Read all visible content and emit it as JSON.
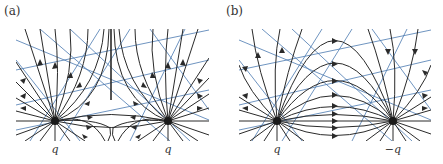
{
  "figure": {
    "panels": [
      {
        "id": "a",
        "label": "(a)",
        "description": "Field lines of two equal positive charges",
        "charges": [
          {
            "label": "q",
            "sign": "+",
            "x": 55,
            "y": 121
          },
          {
            "label": "q",
            "sign": "+",
            "x": 168,
            "y": 121
          }
        ]
      },
      {
        "id": "b",
        "label": "(b)",
        "description": "Field lines of a dipole (positive and negative charge)",
        "charges": [
          {
            "label": "q",
            "sign": "+",
            "x": 277,
            "y": 121
          },
          {
            "label": "−q",
            "sign": "-",
            "x": 393,
            "y": 121
          }
        ]
      }
    ],
    "colors": {
      "field_line": "#2a2a2a",
      "reference_line": "#4a78b0",
      "charge": "#1a1a1a",
      "background": "#ffffff"
    }
  }
}
